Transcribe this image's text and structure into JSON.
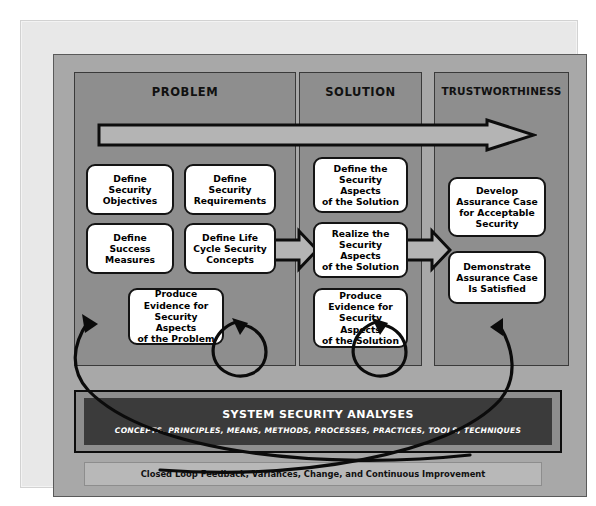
{
  "diagram": {
    "columns": [
      {
        "id": "problem",
        "label": "PROBLEM"
      },
      {
        "id": "solution",
        "label": "SOLUTION"
      },
      {
        "id": "trustworthiness",
        "label": "TRUSTWORTHINESS"
      }
    ],
    "nodes": {
      "define_security_objectives": "Define\nSecurity\nObjectives",
      "define_security_requirements": "Define\nSecurity\nRequirements",
      "define_success_measures": "Define\nSuccess\nMeasures",
      "define_life_cycle_concepts": "Define Life\nCycle Security\nConcepts",
      "produce_evidence_problem": "Produce\nEvidence for\nSecurity Aspects\nof the Problem",
      "define_aspects_solution": "Define the\nSecurity Aspects\nof the Solution",
      "realize_aspects_solution": "Realize the\nSecurity Aspects\nof the Solution",
      "produce_evidence_solution": "Produce\nEvidence for\nSecurity Aspects\nof the Solution",
      "develop_assurance_case": "Develop\nAssurance Case\nfor Acceptable\nSecurity",
      "demonstrate_assurance_case": "Demonstrate\nAssurance Case\nIs Satisfied"
    },
    "analyses": {
      "title": "SYSTEM SECURITY ANALYSES",
      "subtitle": "CONCEPTS, PRINCIPLES, MEANS, METHODS, PROCESSES, PRACTICES, TOOLS, TECHNIQUES"
    },
    "feedback": {
      "label": "Closed Loop Feedback, Variances, Change, and Continuous Improvement"
    },
    "arrows": {
      "top_flow": "progression-arrow-problem-to-trustworthiness",
      "problem_to_solution": "block-arrow-right",
      "solution_to_trustworthiness": "block-arrow-right",
      "loop_problem": "circular-feedback-loop",
      "loop_solution": "circular-feedback-loop",
      "closed_loop_left": "long-feedback-arc-to-problem",
      "closed_loop_right": "long-feedback-arc-to-trustworthiness"
    },
    "colors": {
      "page_background": "#ffffff",
      "frame": "#e8e8e8",
      "canvas": "#a8a8a8",
      "column_panel": "#8e8e8e",
      "analyses_bar": "#3b3b3b",
      "feedback_bar": "#b8b8b8",
      "node_fill": "#ffffff",
      "outline": "#141414"
    }
  }
}
